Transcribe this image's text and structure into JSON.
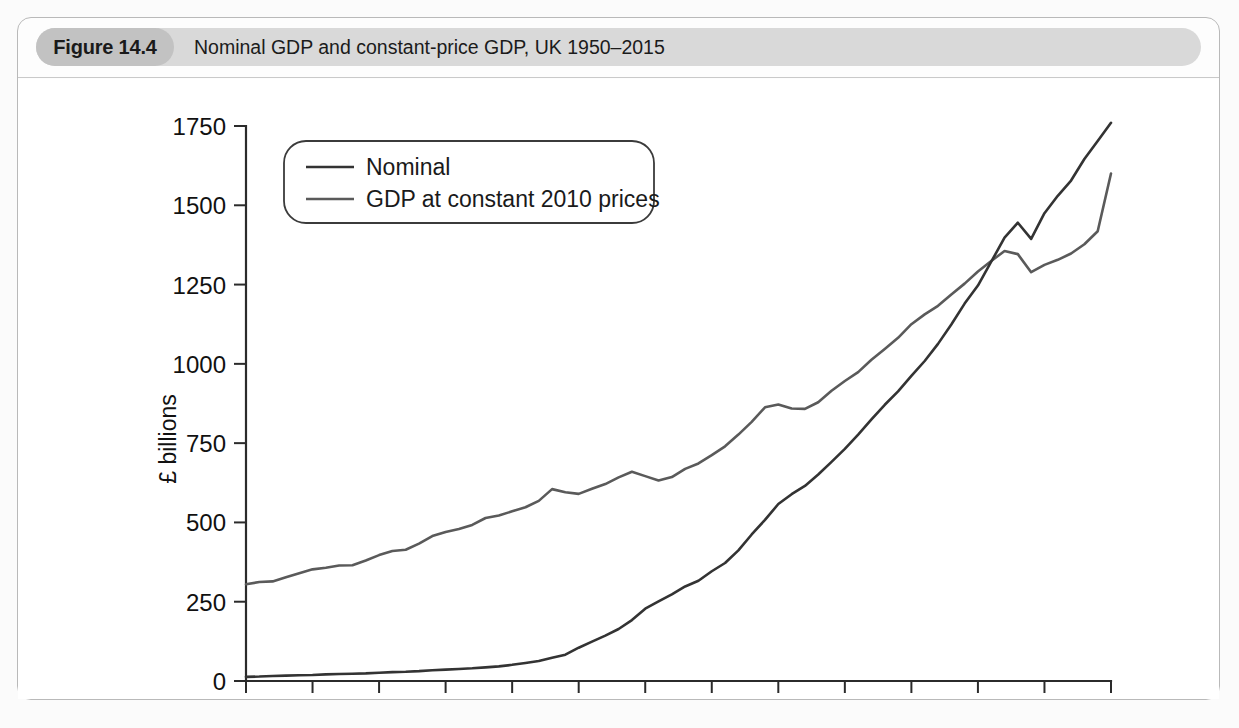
{
  "figure": {
    "number_label": "Figure 14.4",
    "title": "Nominal GDP and constant-price GDP, UK 1950–2015"
  },
  "colors": {
    "nominal_line": "#333333",
    "constant_line": "#5a5a5a",
    "axis": "#2b2b2b",
    "header_band": "#d9d9d9",
    "figure_pill": "#c2c2c2",
    "card_border": "#b9b9b9"
  },
  "legend": {
    "position": "upper-left-inside",
    "entries": [
      {
        "label": "Nominal",
        "color": "#333333"
      },
      {
        "label": "GDP at constant 2010 prices",
        "color": "#5a5a5a"
      }
    ]
  },
  "chart_data": {
    "type": "line",
    "title": "Nominal GDP and constant-price GDP, UK 1950–2015",
    "xlabel": "",
    "ylabel": "£ billions",
    "xlim": [
      1950,
      2015
    ],
    "ylim": [
      0,
      1750
    ],
    "grid": false,
    "xticks": [
      1950,
      1955,
      1960,
      1965,
      1970,
      1975,
      1980,
      1985,
      1990,
      1995,
      2000,
      2005,
      2010,
      2015
    ],
    "xtick_labels": [
      "1950",
      "1955",
      "1960",
      "1965",
      "1970",
      "1975",
      "1980",
      "1985",
      "1990",
      "1995",
      "2000",
      "2005",
      "2010",
      "2015"
    ],
    "yticks": [
      0,
      250,
      500,
      750,
      1000,
      1250,
      1500,
      1750
    ],
    "ytick_labels": [
      "0",
      "250",
      "500",
      "750",
      "1000",
      "1250",
      "1500",
      "1750"
    ],
    "legend_position": "upper left",
    "x": [
      1950,
      1951,
      1952,
      1953,
      1954,
      1955,
      1956,
      1957,
      1958,
      1959,
      1960,
      1961,
      1962,
      1963,
      1964,
      1965,
      1966,
      1967,
      1968,
      1969,
      1970,
      1971,
      1972,
      1973,
      1974,
      1975,
      1976,
      1977,
      1978,
      1979,
      1980,
      1981,
      1982,
      1983,
      1984,
      1985,
      1986,
      1987,
      1988,
      1989,
      1990,
      1991,
      1992,
      1993,
      1994,
      1995,
      1996,
      1997,
      1998,
      1999,
      2000,
      2001,
      2002,
      2003,
      2004,
      2005,
      2006,
      2007,
      2008,
      2009,
      2010,
      2011,
      2012,
      2013,
      2014,
      2015
    ],
    "series": [
      {
        "name": "Nominal",
        "color": "#333333",
        "values": [
          13,
          14,
          16,
          17,
          18,
          19,
          21,
          22,
          23,
          24,
          26,
          28,
          29,
          31,
          34,
          36,
          38,
          40,
          43,
          46,
          51,
          57,
          63,
          73,
          83,
          105,
          124,
          143,
          164,
          192,
          228,
          251,
          273,
          298,
          316,
          346,
          372,
          412,
          462,
          508,
          558,
          589,
          615,
          651,
          691,
          732,
          777,
          825,
          871,
          913,
          962,
          1009,
          1063,
          1124,
          1190,
          1247,
          1322,
          1398,
          1445,
          1394,
          1475,
          1530,
          1578,
          1646,
          1703,
          1760
        ]
      },
      {
        "name": "GDP at constant 2010 prices",
        "color": "#5a5a5a",
        "values": [
          305,
          312,
          314,
          327,
          340,
          352,
          357,
          364,
          365,
          380,
          397,
          410,
          414,
          433,
          457,
          470,
          479,
          492,
          514,
          522,
          535,
          548,
          568,
          605,
          595,
          590,
          606,
          621,
          642,
          660,
          646,
          632,
          643,
          669,
          686,
          712,
          740,
          777,
          817,
          863,
          872,
          859,
          858,
          879,
          915,
          946,
          974,
          1013,
          1047,
          1082,
          1125,
          1156,
          1183,
          1219,
          1253,
          1291,
          1324,
          1356,
          1346,
          1289,
          1312,
          1328,
          1348,
          1377,
          1418,
          1600
        ]
      }
    ]
  },
  "axes_geometry": {
    "x_left_px": 228,
    "x_right_px": 1093,
    "y_bottom_px": 602,
    "y_top_px": 47
  }
}
